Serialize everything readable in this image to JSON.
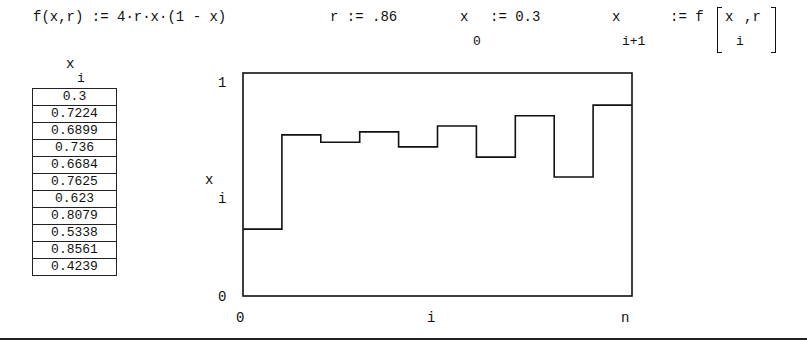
{
  "definitions": {
    "function_def": "f(x,r) := 4·r·x·(1 - x)",
    "r_def": "r := .86",
    "x0_var": "x",
    "x0_sub": "0",
    "x0_assign": ":= 0.3",
    "iter_var": "x",
    "iter_sub": "i+1",
    "iter_assign": ":= f",
    "iter_arg_var": "x",
    "iter_arg_sub": "i",
    "iter_arg_rest": ",r"
  },
  "table": {
    "header_var": "x",
    "header_sub": "i",
    "values": [
      "0.3",
      "0.7224",
      "0.6899",
      "0.736",
      "0.6684",
      "0.7625",
      "0.623",
      "0.8079",
      "0.5338",
      "0.8561",
      "0.4239"
    ]
  },
  "plot": {
    "y_top_tick": "1",
    "y_bottom_tick": "0",
    "y_label_var": "x",
    "y_label_sub": "i",
    "x_left_tick": "0",
    "x_label": "i",
    "x_right_tick": "n"
  },
  "chart_data": {
    "type": "line",
    "style": "step",
    "title": "",
    "xlabel": "i",
    "ylabel": "x_i",
    "x": [
      0,
      1,
      2,
      3,
      4,
      5,
      6,
      7,
      8,
      9,
      10
    ],
    "values": [
      0.3,
      0.7224,
      0.6899,
      0.736,
      0.6684,
      0.7625,
      0.623,
      0.8079,
      0.5338,
      0.8561,
      0.4239
    ],
    "ylim": [
      0,
      1
    ],
    "xlim": [
      "0",
      "n"
    ],
    "grid": false
  }
}
